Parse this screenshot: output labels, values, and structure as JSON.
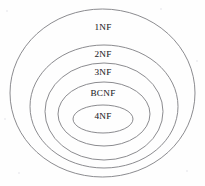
{
  "diagram": {
    "background_color": "#fefefe",
    "stroke_color": "#7e7e82",
    "text_color": "#2b2b2e",
    "canvas": {
      "width": 205,
      "height": 186
    },
    "levels": [
      {
        "label": "1NF",
        "name": "first-normal-form",
        "cx": 102.5,
        "cy": 93,
        "rx": 92.5,
        "ry": 84,
        "label_x": 103,
        "label_y": 28
      },
      {
        "label": "2NF",
        "name": "second-normal-form",
        "cx": 104,
        "cy": 106.5,
        "rx": 74,
        "ry": 61.5,
        "label_x": 103,
        "label_y": 55
      },
      {
        "label": "3NF",
        "name": "third-normal-form",
        "cx": 104,
        "cy": 111.5,
        "rx": 59,
        "ry": 48.5,
        "label_x": 103,
        "label_y": 73
      },
      {
        "label": "BCNF",
        "name": "boyce-codd-normal-form",
        "cx": 104,
        "cy": 114,
        "rx": 46,
        "ry": 32,
        "label_x": 103,
        "label_y": 94
      },
      {
        "label": "4NF",
        "name": "fourth-normal-form",
        "cx": 103,
        "cy": 119,
        "rx": 30,
        "ry": 14,
        "label_x": 103,
        "label_y": 117
      }
    ],
    "specks": [
      {
        "x": 6,
        "y": 10,
        "d": 2
      },
      {
        "x": 196,
        "y": 60,
        "d": 2
      },
      {
        "x": 18,
        "y": 172,
        "d": 2
      },
      {
        "x": 186,
        "y": 170,
        "d": 2
      },
      {
        "x": 4,
        "y": 118,
        "d": 2
      },
      {
        "x": 160,
        "y": 8,
        "d": 2
      }
    ]
  }
}
